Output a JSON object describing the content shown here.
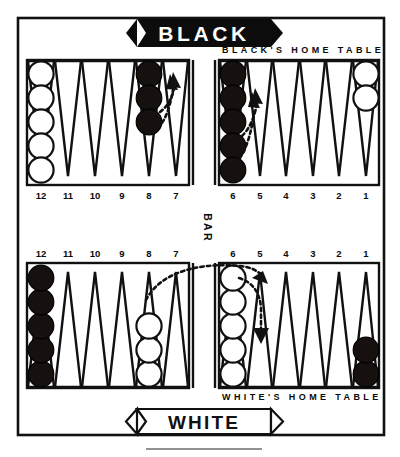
{
  "figure": {
    "kind": "backgammon-board-diagram",
    "top_banner": "BLACK",
    "bottom_banner": "WHITE",
    "bar_label": "BAR",
    "black_home_label": "BLACK'S HOME TABLE",
    "white_home_label": "WHITE'S HOME TABLE"
  },
  "colors": {
    "ink": "#111111",
    "paper": "#ffffff",
    "black_checker": "#16110f",
    "white_checker": "#ffffff"
  },
  "point_numbers": {
    "top_outer": [
      "12",
      "11",
      "10",
      "9",
      "8",
      "7"
    ],
    "top_home": [
      "6",
      "5",
      "4",
      "3",
      "2",
      "1"
    ],
    "bottom_outer": [
      "12",
      "11",
      "10",
      "9",
      "8",
      "7"
    ],
    "bottom_home": [
      "6",
      "5",
      "4",
      "3",
      "2",
      "1"
    ]
  },
  "checkers": {
    "top_outer": [
      {
        "point": "12",
        "color": "white",
        "count": 5
      },
      {
        "point": "11",
        "color": "none",
        "count": 0
      },
      {
        "point": "10",
        "color": "none",
        "count": 0
      },
      {
        "point": "9",
        "color": "none",
        "count": 0
      },
      {
        "point": "8",
        "color": "black",
        "count": 3
      },
      {
        "point": "7",
        "color": "none",
        "count": 0
      }
    ],
    "top_home": [
      {
        "point": "6",
        "color": "black",
        "count": 5
      },
      {
        "point": "5",
        "color": "none",
        "count": 0
      },
      {
        "point": "4",
        "color": "none",
        "count": 0
      },
      {
        "point": "3",
        "color": "none",
        "count": 0
      },
      {
        "point": "2",
        "color": "none",
        "count": 0
      },
      {
        "point": "1",
        "color": "white",
        "count": 2
      }
    ],
    "bottom_outer": [
      {
        "point": "12",
        "color": "black",
        "count": 5
      },
      {
        "point": "11",
        "color": "none",
        "count": 0
      },
      {
        "point": "10",
        "color": "none",
        "count": 0
      },
      {
        "point": "9",
        "color": "none",
        "count": 0
      },
      {
        "point": "8",
        "color": "white",
        "count": 3
      },
      {
        "point": "7",
        "color": "none",
        "count": 0
      }
    ],
    "bottom_home": [
      {
        "point": "6",
        "color": "white",
        "count": 5
      },
      {
        "point": "5",
        "color": "none",
        "count": 0
      },
      {
        "point": "4",
        "color": "none",
        "count": 0
      },
      {
        "point": "3",
        "color": "none",
        "count": 0
      },
      {
        "point": "2",
        "color": "none",
        "count": 0
      },
      {
        "point": "1",
        "color": "black",
        "count": 2
      }
    ]
  },
  "move_arrows": [
    {
      "id": "black-8-to-7-a",
      "from": "top outer 8",
      "to": "top outer 7",
      "style": "dotted-arrow"
    },
    {
      "id": "black-8-to-7-b",
      "from": "top outer 8",
      "to": "top outer 7",
      "style": "dotted-arrow"
    },
    {
      "id": "black-6-to-5-a",
      "from": "top home 6",
      "to": "top home 5",
      "style": "dotted-arrow"
    },
    {
      "id": "black-6-to-5-b",
      "from": "top home 6",
      "to": "top home 5",
      "style": "dotted-arrow"
    },
    {
      "id": "white-8-to-5",
      "from": "bottom outer 8",
      "to": "bottom home 5",
      "style": "dotted-curve-arrow"
    },
    {
      "id": "white-6-to-5",
      "from": "bottom home 6",
      "to": "bottom home 5",
      "style": "dotted-curve-arrow"
    }
  ]
}
